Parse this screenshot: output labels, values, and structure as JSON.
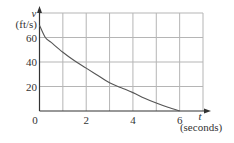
{
  "chart_data": {
    "type": "line",
    "title": "",
    "xlabel": "t (seconds)",
    "ylabel": "v (ft/s)",
    "x_axis_symbol": "t",
    "x_axis_unit": "(seconds)",
    "y_axis_symbol": "v",
    "y_axis_unit": "(ft/s)",
    "xlim": [
      0,
      7
    ],
    "ylim": [
      0,
      80
    ],
    "x_ticks": [
      "0",
      "2",
      "4",
      "6"
    ],
    "y_ticks": [
      "20",
      "40",
      "60"
    ],
    "grid": true,
    "legend": null,
    "series": [
      {
        "name": "v(t)",
        "x": [
          0,
          0.25,
          0.5,
          1,
          1.5,
          2,
          2.5,
          3,
          3.5,
          4,
          4.5,
          5,
          5.5,
          6
        ],
        "values": [
          70,
          60,
          56,
          48,
          41,
          35,
          29,
          23,
          19,
          15,
          10.5,
          6.5,
          3,
          0
        ]
      }
    ],
    "colors": {
      "curve": "#555555",
      "grid": "#b5b5b5",
      "axis": "#333333"
    }
  }
}
